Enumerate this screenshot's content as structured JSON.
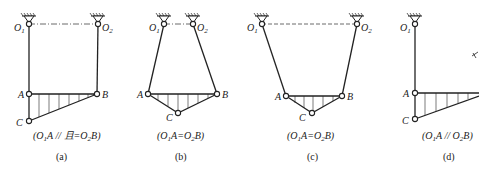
{
  "figures": [
    {
      "id": "a",
      "caption": "(a)",
      "condition": "(O1A // 且=O2B)",
      "condition_parts": [
        "(O",
        "1",
        "A // 且=O",
        "2",
        "B)"
      ],
      "points": {
        "O1": [
          29,
          24
        ],
        "O2": [
          98,
          24
        ],
        "A": [
          29,
          94
        ],
        "B": [
          97,
          94
        ],
        "C": [
          29,
          121
        ]
      },
      "line_style": "dashdot"
    },
    {
      "id": "b",
      "caption": "(b)",
      "condition": "(O1A=O2B)",
      "condition_parts": [
        "(O",
        "1",
        "A=O",
        "2",
        "B)"
      ],
      "points": {
        "O1": [
          164,
          24
        ],
        "O2": [
          193,
          24
        ],
        "A": [
          148,
          94
        ],
        "B": [
          217,
          94
        ],
        "C": [
          178,
          113
        ]
      },
      "line_style": "dashdot"
    },
    {
      "id": "c",
      "caption": "(c)",
      "condition": "(O1A=O2B)",
      "condition_parts": [
        "(O",
        "1",
        "A=O",
        "2",
        "B)"
      ],
      "points": {
        "O1": [
          262,
          24
        ],
        "O2": [
          357,
          24
        ],
        "A": [
          286,
          96
        ],
        "B": [
          342,
          96
        ],
        "C": [
          312,
          113
        ]
      },
      "line_style": "dash"
    },
    {
      "id": "d",
      "caption": "(d)",
      "condition": "(O1A // O2B)",
      "condition_parts": [
        "(O",
        "1",
        "A // O",
        "2",
        "B)"
      ],
      "points": {
        "O1": [
          415,
          24
        ],
        "A": [
          415,
          93
        ],
        "C": [
          415,
          119
        ]
      }
    }
  ],
  "labels": {
    "O": "O",
    "sub1": "1",
    "sub2": "2",
    "A": "A",
    "B": "B",
    "C": "C"
  }
}
